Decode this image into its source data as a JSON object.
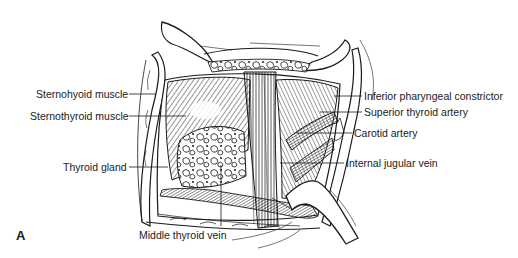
{
  "figure": {
    "panel_letter": "A",
    "labels": {
      "sternohyoid_muscle": "Sternohyoid muscle",
      "sternothyroid_muscle": "Sternothyroid muscle",
      "thyroid_gland": "Thyroid gland",
      "inferior_pharyngeal_constrictor": "Inferior pharyngeal constrictor",
      "superior_thyroid_artery": "Superior thyroid artery",
      "carotid_artery": "Carotid artery",
      "internal_jugular_vein": "Internal jugular vein",
      "middle_thyroid_vein": "Middle thyroid vein"
    },
    "colors": {
      "ink": "#1a1a1a",
      "background": "#ffffff"
    }
  }
}
